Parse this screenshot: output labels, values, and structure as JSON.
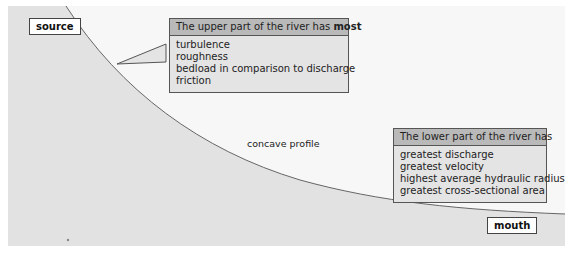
{
  "diagram": {
    "type": "river long profile",
    "colors": {
      "land_fill": "#e2e2e2",
      "sky": "#f7f7f7",
      "curve": "#666666",
      "callout_header": "#b9b9b9",
      "callout_body": "#e4e4e4"
    },
    "labels": {
      "source": "source",
      "mouth": "mouth",
      "curve": "concave profile"
    },
    "upper_callout": {
      "title_prefix": "The upper part of the river has ",
      "title_bold": "most",
      "items": [
        "turbulence",
        "roughness",
        "bedload in comparison to discharge",
        "friction"
      ]
    },
    "lower_callout": {
      "title": "The lower part of the river has",
      "items": [
        "greatest discharge",
        "greatest velocity",
        "highest average hydraulic radius",
        "greatest cross-sectional area"
      ]
    }
  }
}
